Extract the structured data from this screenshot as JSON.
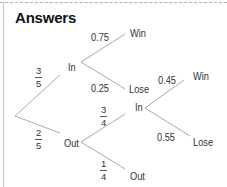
{
  "title": "Answers",
  "colors": {
    "line": "#a8a8a8",
    "text": "#333333",
    "title": "#111111"
  },
  "nodes": {
    "stage1_in": "In",
    "stage1_out": "Out",
    "in_win": "Win",
    "in_lose": "Lose",
    "out_in": "In",
    "out_out": "Out",
    "out_in_win": "Win",
    "out_in_lose": "Lose"
  },
  "probabilities": {
    "p_in": {
      "num": "3",
      "den": "5"
    },
    "p_out": {
      "num": "2",
      "den": "5"
    },
    "in_win": "0.75",
    "in_lose": "0.25",
    "out_in": {
      "num": "3",
      "den": "4"
    },
    "out_out": {
      "num": "1",
      "den": "4"
    },
    "out_in_win": "0.45",
    "out_in_lose": "0.55"
  }
}
